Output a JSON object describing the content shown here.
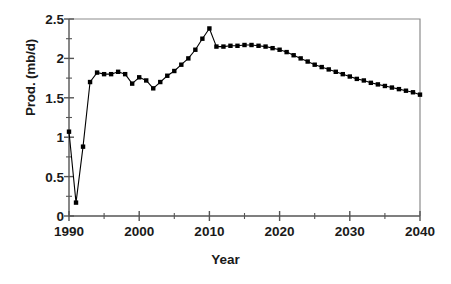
{
  "chart_data": {
    "type": "line",
    "title": "",
    "xlabel": "Year",
    "ylabel": "Prod. (mb/d)",
    "xlim": [
      1990,
      2040
    ],
    "ylim": [
      0,
      2.5
    ],
    "grid": false,
    "legend": "none",
    "marker": "filled-square",
    "line_color": "#000000",
    "marker_color": "#000000",
    "axis_color": "#555555",
    "xticks": [
      1990,
      2000,
      2010,
      2020,
      2030,
      2040
    ],
    "xtick_labels": [
      "1990",
      "2000",
      "2010",
      "2020",
      "2030",
      "2040"
    ],
    "xminor_ticks": [
      1995,
      2005,
      2015,
      2025,
      2035
    ],
    "yticks": [
      0,
      0.5,
      1,
      1.5,
      2,
      2.5
    ],
    "ytick_labels": [
      "0",
      "0.5",
      "1",
      "1.5",
      "2",
      "2.5"
    ],
    "yminor_ticks": [
      0.25,
      0.75,
      1.25,
      1.75,
      2.25
    ],
    "series": [
      {
        "name": "Production",
        "x": [
          1990,
          1991,
          1992,
          1993,
          1994,
          1995,
          1996,
          1997,
          1998,
          1999,
          2000,
          2001,
          2002,
          2003,
          2004,
          2005,
          2006,
          2007,
          2008,
          2009,
          2010,
          2011,
          2012,
          2013,
          2014,
          2015,
          2016,
          2017,
          2018,
          2019,
          2020,
          2021,
          2022,
          2023,
          2024,
          2025,
          2026,
          2027,
          2028,
          2029,
          2030,
          2031,
          2032,
          2033,
          2034,
          2035,
          2036,
          2037,
          2038,
          2039,
          2040
        ],
        "values": [
          1.07,
          0.17,
          0.88,
          1.7,
          1.82,
          1.8,
          1.8,
          1.83,
          1.8,
          1.68,
          1.76,
          1.72,
          1.62,
          1.7,
          1.78,
          1.84,
          1.92,
          2.0,
          2.11,
          2.25,
          2.38,
          2.15,
          2.15,
          2.16,
          2.16,
          2.17,
          2.17,
          2.16,
          2.15,
          2.13,
          2.11,
          2.08,
          2.04,
          2.0,
          1.96,
          1.92,
          1.89,
          1.86,
          1.83,
          1.8,
          1.77,
          1.74,
          1.72,
          1.69,
          1.67,
          1.65,
          1.63,
          1.61,
          1.59,
          1.57,
          1.54
        ]
      }
    ]
  }
}
